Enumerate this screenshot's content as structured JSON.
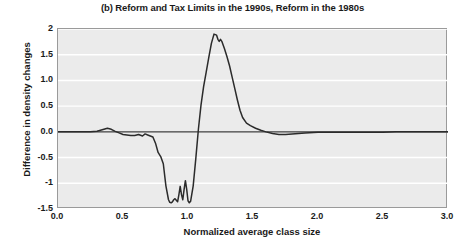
{
  "chart_data": {
    "type": "line",
    "title": "(b) Reform and Tax Limits in the 1990s, Reform in the 1980s",
    "xlabel": "Normalized average class size",
    "ylabel": "Difference in density changes",
    "xlim": [
      0.0,
      3.0
    ],
    "ylim": [
      -1.5,
      2.0
    ],
    "xticks": [
      "0.0",
      "0.5",
      "1.0",
      "1.5",
      "2.0",
      "2.5",
      "3.0"
    ],
    "xtick_values": [
      0.0,
      0.5,
      1.0,
      1.5,
      2.0,
      2.5,
      3.0
    ],
    "yticks": [
      "2",
      "1.5",
      "1.0",
      "0.5",
      "0.0",
      "-0.5",
      "-1",
      "-1.5"
    ],
    "ytick_values": [
      2.0,
      1.5,
      1.0,
      0.5,
      0.0,
      -0.5,
      -1.0,
      -1.5
    ],
    "grid": true,
    "grid_color": "#ffffff",
    "plot_background": "#ebebeb",
    "line_color": "#2b2b2b",
    "zero_line": true,
    "legend": null,
    "series": [
      {
        "name": "Difference in density changes",
        "x": [
          0.0,
          0.05,
          0.1,
          0.15,
          0.2,
          0.25,
          0.3,
          0.34,
          0.38,
          0.41,
          0.44,
          0.47,
          0.5,
          0.53,
          0.56,
          0.59,
          0.62,
          0.65,
          0.67,
          0.69,
          0.71,
          0.73,
          0.75,
          0.77,
          0.79,
          0.81,
          0.83,
          0.85,
          0.86,
          0.87,
          0.88,
          0.89,
          0.9,
          0.91,
          0.92,
          0.93,
          0.94,
          0.95,
          0.96,
          0.97,
          0.98,
          0.99,
          1.0,
          1.01,
          1.02,
          1.04,
          1.06,
          1.08,
          1.1,
          1.12,
          1.14,
          1.16,
          1.18,
          1.2,
          1.22,
          1.23,
          1.24,
          1.25,
          1.26,
          1.28,
          1.3,
          1.32,
          1.34,
          1.36,
          1.38,
          1.4,
          1.42,
          1.45,
          1.48,
          1.52,
          1.56,
          1.6,
          1.65,
          1.7,
          1.75,
          1.8,
          1.9,
          2.0,
          2.1,
          2.2,
          2.3,
          2.4,
          2.5,
          2.6,
          2.7,
          2.8,
          2.9,
          3.0
        ],
        "y": [
          0.0,
          0.0,
          0.0,
          0.0,
          0.0,
          0.0,
          0.01,
          0.04,
          0.07,
          0.05,
          0.01,
          -0.02,
          -0.05,
          -0.06,
          -0.07,
          -0.07,
          -0.05,
          -0.08,
          -0.04,
          -0.06,
          -0.08,
          -0.1,
          -0.22,
          -0.4,
          -0.48,
          -0.62,
          -1.05,
          -1.32,
          -1.37,
          -1.38,
          -1.36,
          -1.32,
          -1.3,
          -1.33,
          -1.36,
          -1.22,
          -1.06,
          -1.22,
          -1.32,
          -1.12,
          -0.95,
          -1.12,
          -1.34,
          -1.38,
          -1.35,
          -1.05,
          -0.52,
          0.05,
          0.52,
          0.88,
          1.16,
          1.45,
          1.72,
          1.9,
          1.88,
          1.8,
          1.76,
          1.8,
          1.76,
          1.62,
          1.46,
          1.28,
          1.06,
          0.84,
          0.62,
          0.42,
          0.28,
          0.17,
          0.12,
          0.07,
          0.03,
          0.0,
          -0.03,
          -0.05,
          -0.05,
          -0.04,
          -0.02,
          -0.01,
          -0.01,
          -0.01,
          -0.01,
          -0.01,
          -0.01,
          0.0,
          0.0,
          0.0,
          0.0,
          0.0
        ]
      }
    ]
  }
}
